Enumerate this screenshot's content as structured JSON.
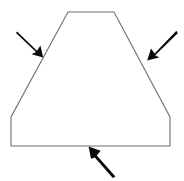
{
  "figure": {
    "canvas": {
      "width": 184,
      "height": 181
    },
    "background_color": "#ffffff"
  },
  "shape": {
    "name": "trapezoid-with-straight-sides",
    "outline_color": "#6e6e6e",
    "fill_color": "#ffffff",
    "stroke_width": 1.1,
    "vertices": [
      {
        "label": "top-left",
        "x": 68,
        "y": 12
      },
      {
        "label": "top-right",
        "x": 114,
        "y": 12
      },
      {
        "label": "right-slant-bottom",
        "x": 170,
        "y": 117
      },
      {
        "label": "bottom-right",
        "x": 170,
        "y": 146
      },
      {
        "label": "bottom-left",
        "x": 11,
        "y": 146
      },
      {
        "label": "left-slant-bottom",
        "x": 11,
        "y": 117
      }
    ],
    "path": "M 68 12 L 114 12 L 170 117 L 170 146 L 11 146 L 11 117 Z",
    "edges": [
      {
        "name": "top-edge",
        "from": "top-left",
        "to": "top-right"
      },
      {
        "name": "right-slanted-edge",
        "from": "top-right",
        "to": "right-slant-bottom"
      },
      {
        "name": "right-vertical-edge",
        "from": "right-slant-bottom",
        "to": "bottom-right"
      },
      {
        "name": "bottom-edge",
        "from": "bottom-right",
        "to": "bottom-left"
      },
      {
        "name": "left-vertical-edge",
        "from": "bottom-left",
        "to": "left-slant-bottom"
      },
      {
        "name": "left-slanted-edge",
        "from": "left-slant-bottom",
        "to": "top-left"
      }
    ]
  },
  "arrows": [
    {
      "name": "arrow-pointing-to-left-slanted-edge",
      "color": "#0a0a0a",
      "direction": "down-right",
      "tail": {
        "x": 18,
        "y": 33
      },
      "tip": {
        "x": 42,
        "y": 56
      },
      "target_edge": "left-slanted-edge",
      "shaft_width": 2.2,
      "head_length": 11,
      "head_width": 9,
      "path": "M 17.0 31.6 L 37.0 50.8 L 40.4 45.6 L 43.2 57.4 L 31.6 54.2 L 36.0 52.0 L 16.0 33.0 Z"
    },
    {
      "name": "arrow-pointing-to-right-slanted-edge",
      "color": "#0a0a0a",
      "direction": "down-left",
      "tail": {
        "x": 175,
        "y": 32
      },
      "tip": {
        "x": 148,
        "y": 60
      },
      "target_edge": "right-slanted-edge",
      "shaft_width": 2.2,
      "head_length": 11,
      "head_width": 9,
      "path": "M 176.4 30.8 L 154.6 53.4 L 151.0 48.4 L 147.2 60.4 L 159.2 57.6 L 155.2 55.2 L 177.8 33.2 Z"
    },
    {
      "name": "arrow-pointing-to-bottom-edge",
      "color": "#0a0a0a",
      "direction": "up-left",
      "tail": {
        "x": 114,
        "y": 175
      },
      "tip": {
        "x": 89,
        "y": 147
      },
      "target_edge": "bottom-edge",
      "shaft_width": 2.2,
      "head_length": 11,
      "head_width": 9,
      "path": "M 115.4 176.4 L 96.8 155.6 L 100.6 150.8 L 88.6 146.6 L 91.0 158.8 L 94.8 157.4 L 112.8 178.0 Z"
    }
  ]
}
